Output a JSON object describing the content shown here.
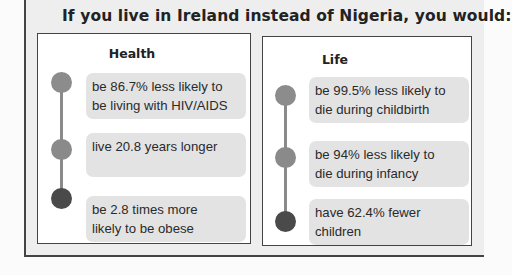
{
  "title": "If you live in Ireland instead of Nigeria, you would:",
  "countries": {
    "home": "Nigeria",
    "compare": "Ireland"
  },
  "colors": {
    "dot_light": "#8c8c8c",
    "dot_mid": "#8a8a8a",
    "dot_dark": "#4a4a4a",
    "card_bg": "#e3e3e3",
    "frame_bg": "#eeeeee"
  },
  "panels": [
    {
      "heading": "Health",
      "items": [
        {
          "line1": "be 86.7% less likely to",
          "line2": "be living with HIV/AIDS"
        },
        {
          "line1": "live 20.8 years longer",
          "line2": ""
        },
        {
          "line1": "be 2.8 times more",
          "line2": "likely to be obese"
        }
      ]
    },
    {
      "heading": "Life",
      "items": [
        {
          "line1": "be 99.5% less likely to",
          "line2": "die during childbirth"
        },
        {
          "line1": "be 94% less likely to",
          "line2": "die during infancy"
        },
        {
          "line1": "have 62.4% fewer",
          "line2": "children"
        }
      ]
    }
  ]
}
